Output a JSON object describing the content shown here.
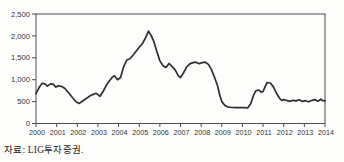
{
  "source_note": "자료: LIG투자증권.",
  "colors": {
    "line": "#2e2e2e",
    "axis": "#4d4d4d",
    "label": "#333333",
    "background": "#fdfdfc"
  },
  "chart_data": {
    "type": "line",
    "title": "",
    "xlabel": "",
    "ylabel": "",
    "grid": false,
    "frame": "box",
    "legend": "none",
    "x_range": [
      2000,
      2014
    ],
    "y_range": [
      0,
      2500
    ],
    "x_tick_labels": [
      "2000",
      "2001",
      "2002",
      "2003",
      "2004",
      "2005",
      "2006",
      "2007",
      "2008",
      "2009",
      "2010",
      "2011",
      "2012",
      "2013",
      "2014"
    ],
    "x_tick_values": [
      2000,
      2001,
      2002,
      2003,
      2004,
      2005,
      2006,
      2007,
      2008,
      2009,
      2010,
      2011,
      2012,
      2013,
      2014
    ],
    "y_tick_labels": [
      "0",
      "500",
      "1,000",
      "1,500",
      "2,000",
      "2,500"
    ],
    "y_tick_values": [
      0,
      500,
      1000,
      1500,
      2000,
      2500
    ],
    "series": [
      {
        "name": "value",
        "x": [
          2000,
          2000.15,
          2000.3,
          2000.45,
          2000.55,
          2000.7,
          2000.85,
          2000.95,
          2001.1,
          2001.25,
          2001.4,
          2001.6,
          2001.8,
          2001.95,
          2002.1,
          2002.25,
          2002.4,
          2002.6,
          2002.75,
          2002.9,
          2003,
          2003.1,
          2003.25,
          2003.4,
          2003.55,
          2003.7,
          2003.8,
          2003.95,
          2004.1,
          2004.25,
          2004.4,
          2004.55,
          2004.7,
          2004.85,
          2005,
          2005.15,
          2005.3,
          2005.45,
          2005.6,
          2005.7,
          2005.85,
          2006,
          2006.15,
          2006.3,
          2006.45,
          2006.6,
          2006.75,
          2006.9,
          2007,
          2007.15,
          2007.3,
          2007.45,
          2007.6,
          2007.75,
          2007.9,
          2008.05,
          2008.2,
          2008.35,
          2008.5,
          2008.65,
          2008.8,
          2008.9,
          2009,
          2009.15,
          2009.3,
          2009.5,
          2009.7,
          2009.9,
          2010.1,
          2010.25,
          2010.4,
          2010.55,
          2010.65,
          2010.8,
          2010.9,
          2011,
          2011.1,
          2011.2,
          2011.35,
          2011.5,
          2011.65,
          2011.8,
          2011.9,
          2012,
          2012.15,
          2012.3,
          2012.45,
          2012.6,
          2012.75,
          2012.9,
          2013.05,
          2013.2,
          2013.35,
          2013.5,
          2013.65,
          2013.8,
          2013.9,
          2014
        ],
        "y": [
          680,
          820,
          920,
          900,
          855,
          905,
          895,
          830,
          860,
          845,
          800,
          690,
          570,
          490,
          460,
          510,
          560,
          625,
          660,
          690,
          660,
          620,
          730,
          865,
          970,
          1060,
          1090,
          1000,
          1050,
          1300,
          1450,
          1480,
          1560,
          1650,
          1740,
          1820,
          1950,
          2110,
          1990,
          1880,
          1650,
          1430,
          1320,
          1280,
          1370,
          1300,
          1220,
          1090,
          1050,
          1160,
          1290,
          1360,
          1390,
          1400,
          1365,
          1390,
          1400,
          1350,
          1230,
          1050,
          850,
          650,
          500,
          410,
          375,
          365,
          360,
          365,
          360,
          355,
          450,
          660,
          745,
          765,
          715,
          730,
          840,
          935,
          925,
          835,
          690,
          575,
          525,
          545,
          525,
          505,
          530,
          515,
          540,
          505,
          520,
          495,
          525,
          545,
          510,
          555,
          520,
          515
        ]
      }
    ]
  }
}
